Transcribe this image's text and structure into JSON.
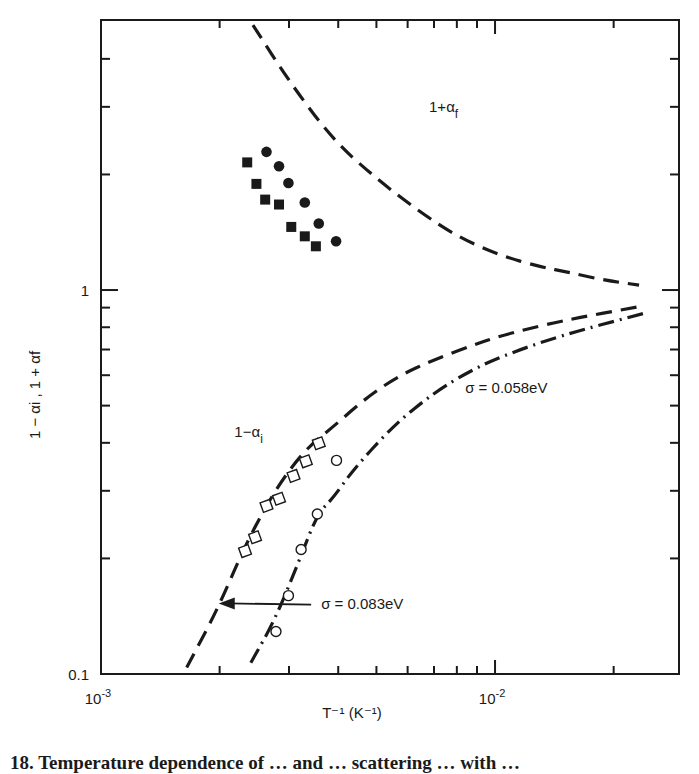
{
  "chart_data": {
    "type": "scatter",
    "title": "",
    "xlabel": "T⁻¹ (K⁻¹)",
    "ylabel": "1 − αi , 1 + αf",
    "xscale": "log",
    "yscale": "log",
    "xlim": [
      0.001,
      0.0293
    ],
    "ylim": [
      0.1,
      5.05
    ],
    "x_tick_labels": [
      {
        "value": 0.001,
        "base": "10",
        "exp": "-3"
      },
      {
        "value": 0.01,
        "base": "10",
        "exp": "-2"
      }
    ],
    "x_minor_ticks": [
      0.002,
      0.003,
      0.004,
      0.005,
      0.006,
      0.007,
      0.008,
      0.009,
      0.02
    ],
    "y_tick_labels": [
      {
        "value": 0.1,
        "label": "0.1"
      },
      {
        "value": 1,
        "label": "1"
      }
    ],
    "y_minor_ticks": [
      0.2,
      0.3,
      0.4,
      0.5,
      0.6,
      0.7,
      0.8,
      0.9,
      2,
      3,
      4,
      5
    ],
    "grid": false,
    "series": [
      {
        "name": "filled circles",
        "kind": "points",
        "marker": "filled-circle",
        "x": [
          0.00263,
          0.00283,
          0.00299,
          0.00329,
          0.00357,
          0.00395
        ],
        "y": [
          2.29,
          2.1,
          1.9,
          1.69,
          1.49,
          1.34
        ]
      },
      {
        "name": "filled squares",
        "kind": "points",
        "marker": "filled-square",
        "x": [
          0.00235,
          0.00248,
          0.00261,
          0.00283,
          0.00304,
          0.00329,
          0.00351
        ],
        "y": [
          2.15,
          1.89,
          1.72,
          1.67,
          1.46,
          1.38,
          1.3
        ]
      },
      {
        "name": "open squares",
        "kind": "points",
        "marker": "open-square",
        "x": [
          0.00232,
          0.00246,
          0.00263,
          0.00283,
          0.00308,
          0.00331,
          0.00357
        ],
        "y": [
          0.209,
          0.227,
          0.274,
          0.286,
          0.328,
          0.358,
          0.399
        ]
      },
      {
        "name": "open circles",
        "kind": "points",
        "marker": "open-circle",
        "x": [
          0.00278,
          0.00299,
          0.00322,
          0.00354,
          0.00396
        ],
        "y": [
          0.129,
          0.16,
          0.211,
          0.261,
          0.36
        ]
      },
      {
        "name": "1+αf",
        "kind": "line",
        "style": "dashed",
        "x": [
          0.00243,
          0.003,
          0.00388,
          0.005,
          0.00638,
          0.008,
          0.0103,
          0.013,
          0.0155,
          0.019,
          0.0232
        ],
        "y": [
          4.9,
          3.5,
          2.46,
          1.95,
          1.61,
          1.38,
          1.23,
          1.15,
          1.11,
          1.06,
          1.03
        ]
      },
      {
        "name": "1−αi (σ=0.083eV)",
        "kind": "line",
        "style": "dashed",
        "x": [
          0.00165,
          0.00198,
          0.00232,
          0.00276,
          0.0033,
          0.00388,
          0.00473,
          0.00574,
          0.00695,
          0.0085,
          0.0103,
          0.0146,
          0.0239
        ],
        "y": [
          0.104,
          0.148,
          0.216,
          0.301,
          0.385,
          0.44,
          0.526,
          0.6,
          0.656,
          0.71,
          0.76,
          0.83,
          0.91
        ]
      },
      {
        "name": "σ=0.058eV",
        "kind": "line",
        "style": "dash-dot",
        "x": [
          0.0024,
          0.00276,
          0.0032,
          0.00354,
          0.00388,
          0.00436,
          0.00554,
          0.007,
          0.0085,
          0.0103,
          0.0146,
          0.0239
        ],
        "y": [
          0.107,
          0.138,
          0.2,
          0.261,
          0.287,
          0.34,
          0.445,
          0.54,
          0.61,
          0.67,
          0.76,
          0.87
        ]
      }
    ],
    "annotations": [
      {
        "id": "label-upper",
        "text_main": "1+α",
        "text_sub": "f",
        "x": 0.0068,
        "y": 2.9
      },
      {
        "id": "label-lower",
        "text_main": "1−α",
        "text_sub": "i",
        "x": 0.00218,
        "y": 0.415
      },
      {
        "id": "sigma-058",
        "text": "σ = 0.058eV",
        "x": 0.0084,
        "y": 0.54
      },
      {
        "id": "sigma-083",
        "text": "σ = 0.083eV",
        "x": 0.00362,
        "y": 0.148,
        "arrow_to": {
          "x": 0.00199,
          "y": 0.15
        }
      }
    ]
  },
  "caption": "18.  Temperature dependence of … and … scattering … with …"
}
